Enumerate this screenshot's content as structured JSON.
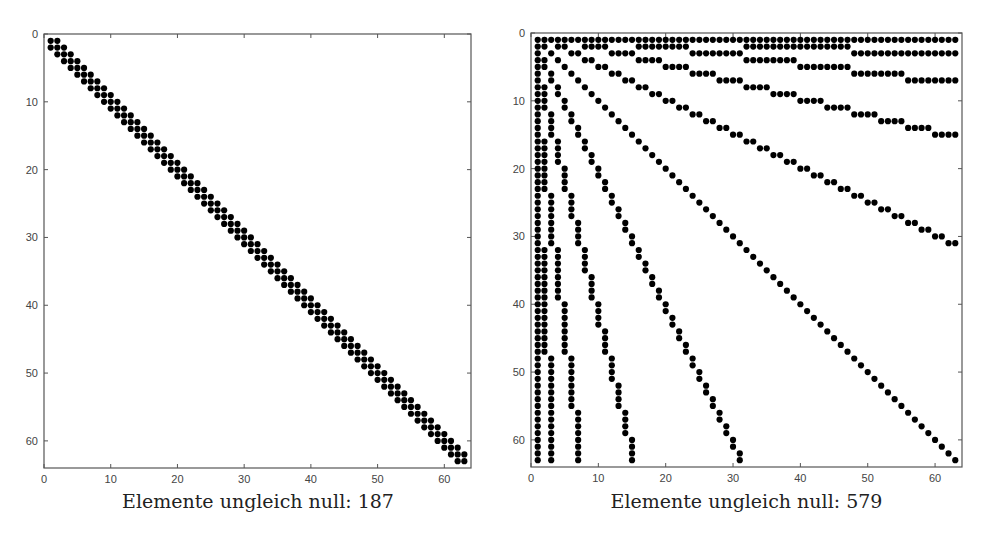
{
  "chart_data": [
    {
      "type": "scatter",
      "subtype": "sparsity-pattern (spy plot)",
      "title": "",
      "xlabel": "Elemente ungleich null: 187",
      "ylabel": "",
      "matrix_size": 63,
      "nonzeros": 187,
      "pattern": "tridiagonal",
      "description": "Nonzero (i,j) where |i-j| <= 1, for i,j in 1..63",
      "xlim": [
        0,
        64
      ],
      "ylim": [
        64,
        0
      ],
      "y_axis_reversed": true,
      "xticks": [
        0,
        10,
        20,
        30,
        40,
        50,
        60
      ],
      "yticks": [
        0,
        10,
        20,
        30,
        40,
        50,
        60
      ],
      "grid": false,
      "marker": "filled circle",
      "marker_color": "#000000"
    },
    {
      "type": "scatter",
      "subtype": "sparsity-pattern (spy plot)",
      "title": "",
      "xlabel": "Elemente ungleich null: 579",
      "ylabel": "",
      "matrix_size": 63,
      "nonzeros": 579,
      "pattern": "binary-tree ancestor/descendant (heap numbering, symmetric)",
      "description": "Nonzero (i,j) where i is an ancestor of, descendant of, or equal to j in a heap-numbered binary tree (node k has children 2k, 2k+1), i,j in 1..63",
      "xlim": [
        0,
        64
      ],
      "ylim": [
        64,
        0
      ],
      "y_axis_reversed": true,
      "xticks": [
        0,
        10,
        20,
        30,
        40,
        50,
        60
      ],
      "yticks": [
        0,
        10,
        20,
        30,
        40,
        50,
        60
      ],
      "grid": false,
      "marker": "filled circle",
      "marker_color": "#000000"
    }
  ],
  "panels": [
    {
      "caption": "Elemente ungleich null: 187"
    },
    {
      "caption": "Elemente ungleich null: 579"
    }
  ]
}
